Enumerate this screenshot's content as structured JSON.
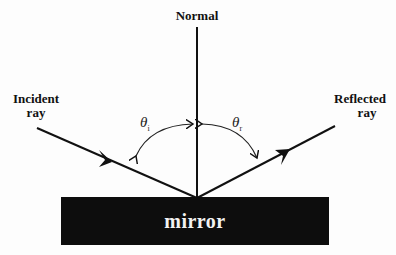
{
  "diagram": {
    "labels": {
      "normal": "Normal",
      "incident_line1": "Incident",
      "incident_line2": "ray",
      "reflected_line1": "Reflected",
      "reflected_line2": "ray",
      "mirror": "mirror",
      "theta_i_symbol": "θ",
      "theta_i_sub": "i",
      "theta_r_symbol": "θ",
      "theta_r_sub": "r"
    },
    "colors": {
      "line": "#111111",
      "mirror_fill": "#0d0d0d",
      "mirror_text": "#f2f2f2",
      "background": "#fdfdfd"
    }
  }
}
